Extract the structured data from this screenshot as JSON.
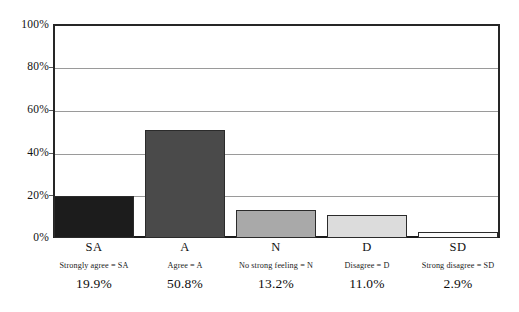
{
  "chart_data": {
    "type": "bar",
    "title": "",
    "subtitle": "",
    "xlabel": "",
    "ylabel": "",
    "ylim": [
      0,
      100
    ],
    "grid": true,
    "legend_position": "none",
    "categories": [
      "SA",
      "A",
      "N",
      "D",
      "SD"
    ],
    "values": [
      19.9,
      50.8,
      13.2,
      11.0,
      2.9
    ],
    "value_labels": [
      "19.9%",
      "50.8%",
      "13.2%",
      "11.0%",
      "2.9%"
    ],
    "category_descriptions": [
      "Strongly agree = SA",
      "Agree = A",
      "No strong feeling = N",
      "Disagree = D",
      "Strong disagree = SD"
    ],
    "bar_colors": [
      "#1c1c1c",
      "#4a4a4a",
      "#a9a9a9",
      "#dcdcdc",
      "#fbfbfb"
    ],
    "yticks": [
      0,
      20,
      40,
      60,
      80,
      100
    ],
    "ytick_labels": [
      "0%",
      "20%",
      "40%",
      "60%",
      "80%",
      "100%"
    ]
  },
  "axis": {
    "y": {
      "labels": [
        "100%",
        "80%",
        "60%",
        "40%",
        "20%",
        "0%"
      ]
    }
  },
  "bars": [
    {
      "category": "SA",
      "description": "Strongly agree = SA",
      "value_label": "19.9%",
      "value": 19.9,
      "color": "#1c1c1c"
    },
    {
      "category": "A",
      "description": "Agree = A",
      "value_label": "50.8%",
      "value": 50.8,
      "color": "#4a4a4a"
    },
    {
      "category": "N",
      "description": "No strong feeling = N",
      "value_label": "13.2%",
      "value": 13.2,
      "color": "#a9a9a9"
    },
    {
      "category": "D",
      "description": "Disagree = D",
      "value_label": "11.0%",
      "value": 11.0,
      "color": "#dcdcdc"
    },
    {
      "category": "SD",
      "description": "Strong disagree = SD",
      "value_label": "2.9%",
      "value": 2.9,
      "color": "#fbfbfb"
    }
  ]
}
